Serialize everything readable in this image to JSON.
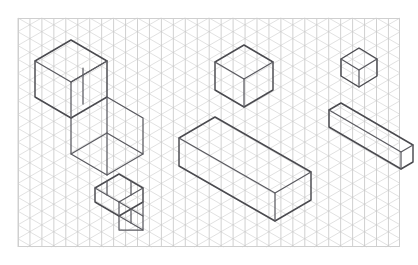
{
  "page": {
    "background_color": "#ffffff",
    "width": 418,
    "height": 265
  },
  "frame": {
    "label": "Isometric paper frame",
    "x": 18,
    "y": 18,
    "width": 382,
    "height": 229,
    "stroke_color": "#cfcfcf"
  },
  "grid": {
    "label": "Isometric triangular grid",
    "cell_width": 23.9,
    "cell_height": 13.8,
    "angle_degrees": 30,
    "line_color": "#c8c8c8",
    "vertical_line_color": "#bdbdbd",
    "columns": 16,
    "rows": 17
  },
  "style": {
    "edge_color": "#4a4a4f",
    "edge_width": 1.45
  },
  "shapes": [
    {
      "name": "large-stepped-block",
      "description": "Large stepped L-shaped block, upper left, two levels descending to the right",
      "position": "upper-left",
      "paths": [
        "M 35,61 L 35,97 L 71,118 L 107,97 L 107,61 L 71,40 Z",
        "M 35,61 L 71,82 L 107,61",
        "M 71,82 L 71,118",
        "M 71,82 L 107,61",
        "M 83,68 L 83,104",
        "M 107,97 L 143,118 L 143,154 L 107,175 L 71,154 L 71,118",
        "M 107,97 L 107,133 L 143,154",
        "M 107,133 L 71,154",
        "M 107,133 L 107,175"
      ]
    },
    {
      "name": "small-stepped-block",
      "description": "Small stepped block, lower left, two small cubes offset diagonally",
      "position": "lower-left",
      "paths": [
        "M 95,188 L 95,202 L 119,216 L 143,202 L 143,188 L 119,174 Z",
        "M 95,188 L 119,202 L 143,188",
        "M 119,202 L 119,216",
        "M 107,181 L 107,195",
        "M 131,181 L 131,195",
        "M 119,202 L 143,216 L 143,230 L 119,216",
        "M 143,202 L 143,216",
        "M 119,216 L 119,230 L 143,230",
        "M 131,209 L 131,223"
      ]
    },
    {
      "name": "medium-cube",
      "description": "Medium cube, upper center",
      "position": "upper-center",
      "paths": [
        "M 215,62 L 215,90 L 244,107 L 273,90 L 273,62 L 244,45 Z",
        "M 215,62 L 244,79 L 273,62",
        "M 244,79 L 244,107"
      ]
    },
    {
      "name": "long-rectangular-prism",
      "description": "Long rectangular prism, center bottom, elongated along one isometric axis",
      "position": "center-bottom",
      "paths": [
        "M 179,138 L 179,166 L 275,221 L 311,200 L 311,172 L 215,117 Z",
        "M 179,138 L 275,193 L 311,172",
        "M 275,193 L 275,221"
      ]
    },
    {
      "name": "tiny-cube",
      "description": "Tiny cube, top right corner",
      "position": "top-right",
      "paths": [
        "M 341,59 L 341,76 L 359,87 L 377,76 L 377,59 L 359,48 Z",
        "M 341,59 L 359,70 L 377,59",
        "M 359,70 L 359,87"
      ]
    },
    {
      "name": "flat-rectangular-slab",
      "description": "Flat wide rectangular slab, right side, clipped by right frame edge",
      "position": "right-middle",
      "paths": [
        "M 329,110 L 329,127 L 401,169 L 413,162 L 413,145 L 341,103 Z",
        "M 329,110 L 401,152 L 413,145",
        "M 401,152 L 401,169"
      ]
    }
  ]
}
